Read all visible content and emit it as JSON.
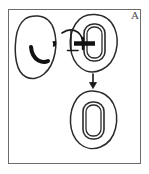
{
  "figure": {
    "panel_label": "A",
    "caption_text": "",
    "colors": {
      "outline": "#2b2b2b",
      "frame": "#6b6b6b",
      "fill_dark": "#111111",
      "background": "#ffffff",
      "label": "#4a4a4a"
    },
    "elements": [
      {
        "name": "left-tissue-blob",
        "label": "",
        "description": "irregular oval tissue outline with dark crescent lesion"
      },
      {
        "name": "upper-tissue-blob",
        "label": "",
        "description": "tissue outline containing implant and delivery needle"
      },
      {
        "name": "implant-device-upper",
        "label": "",
        "description": "rounded rectangular implant with double outline"
      },
      {
        "name": "delivery-needle",
        "label": "",
        "description": "curved needle entering implant from left"
      },
      {
        "name": "transition-arrow",
        "label": "",
        "description": "downward arrow from upper blob to lower blob"
      },
      {
        "name": "lower-tissue-blob",
        "label": "",
        "description": "tissue outline containing seated implant"
      },
      {
        "name": "implant-device-lower",
        "label": "",
        "description": "rounded rectangular implant with double outline"
      }
    ]
  }
}
